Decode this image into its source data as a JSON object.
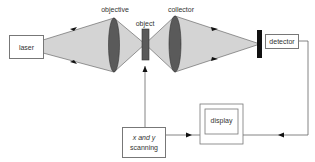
{
  "diagram": {
    "type": "optical scanning microscope schematic",
    "components": {
      "laser": {
        "label": "laser"
      },
      "objective": {
        "label": "objective"
      },
      "object": {
        "label": "object"
      },
      "collector": {
        "label": "collector"
      },
      "detector": {
        "label": "detector"
      },
      "scanning": {
        "label_line1": "x and y",
        "label_line2": "scanning"
      },
      "display": {
        "label": "display"
      }
    },
    "colors": {
      "beam": "#d4d4d4",
      "lens": "#555555",
      "object": "#5a5a5a",
      "detector_bar": "#111111",
      "line": "#666666"
    },
    "connections": [
      {
        "from": "laser",
        "to": "objective",
        "kind": "beam"
      },
      {
        "from": "objective",
        "to": "object",
        "kind": "beam"
      },
      {
        "from": "object",
        "to": "collector",
        "kind": "beam"
      },
      {
        "from": "collector",
        "to": "detector",
        "kind": "beam"
      },
      {
        "from": "scanning",
        "to": "object",
        "kind": "arrow"
      },
      {
        "from": "scanning",
        "to": "display",
        "kind": "arrow"
      },
      {
        "from": "detector",
        "to": "display",
        "kind": "arrow"
      }
    ]
  }
}
